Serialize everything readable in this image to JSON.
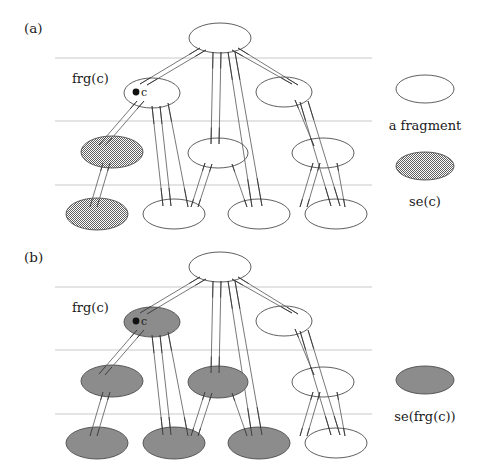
{
  "figure": {
    "background_color": "#ffffff",
    "outline_color": "#4d4d4d",
    "edge_color": "#555555",
    "guide_line_color": "#c9c9c9",
    "marker_color": "#111111",
    "text_color": "#1a1a1a",
    "shade_color_a": "#9a9a9a",
    "shade_color_b": "#8c8c8c"
  },
  "panels": [
    {
      "id": "a",
      "label": "(a)",
      "frg_label": "frg(c)",
      "c_label": "c",
      "legend": [
        {
          "id": "legend-fragment-a",
          "label": "a fragment",
          "style": "outline"
        },
        {
          "id": "legend-se-c",
          "label": "se(c)",
          "style": "shaded-halftone"
        }
      ],
      "guide_lines_y": [
        58,
        121,
        185
      ],
      "guide_line_x": [
        55,
        372
      ],
      "nodes": [
        {
          "id": "a-root",
          "cx": 220,
          "cy": 38,
          "rx": 31,
          "ry": 15,
          "shaded": false
        },
        {
          "id": "a-l2-1",
          "cx": 152,
          "cy": 93,
          "rx": 28,
          "ry": 15,
          "shaded": false,
          "marked": true
        },
        {
          "id": "a-l2-2",
          "cx": 284,
          "cy": 92,
          "rx": 28,
          "ry": 15,
          "shaded": false
        },
        {
          "id": "a-l3-1",
          "cx": 112,
          "cy": 152,
          "rx": 31,
          "ry": 16,
          "shaded": true
        },
        {
          "id": "a-l3-2",
          "cx": 218,
          "cy": 153,
          "rx": 30,
          "ry": 15,
          "shaded": false
        },
        {
          "id": "a-l3-3",
          "cx": 323,
          "cy": 153,
          "rx": 31,
          "ry": 15,
          "shaded": false
        },
        {
          "id": "a-l4-1",
          "cx": 97,
          "cy": 214,
          "rx": 31,
          "ry": 16,
          "shaded": true
        },
        {
          "id": "a-l4-2",
          "cx": 174,
          "cy": 214,
          "rx": 31,
          "ry": 15,
          "shaded": false
        },
        {
          "id": "a-l4-3",
          "cx": 259,
          "cy": 214,
          "rx": 31,
          "ry": 15,
          "shaded": false
        },
        {
          "id": "a-l4-4",
          "cx": 336,
          "cy": 214,
          "rx": 31,
          "ry": 15,
          "shaded": false
        }
      ],
      "edges": [
        [
          200,
          48,
          140,
          84
        ],
        [
          206,
          50,
          147,
          85
        ],
        [
          213,
          52,
          211,
          144
        ],
        [
          221,
          52,
          219,
          144
        ],
        [
          232,
          50,
          292,
          84
        ],
        [
          238,
          48,
          298,
          85
        ],
        [
          137,
          101,
          99,
          145
        ],
        [
          144,
          101,
          105,
          146
        ],
        [
          152,
          106,
          163,
          206
        ],
        [
          160,
          106,
          171,
          206
        ],
        [
          168,
          103,
          188,
          207
        ],
        [
          228,
          52,
          252,
          207
        ],
        [
          235,
          52,
          262,
          206
        ],
        [
          300,
          102,
          331,
          206
        ],
        [
          308,
          101,
          340,
          206
        ],
        [
          295,
          100,
          314,
          146
        ],
        [
          103,
          163,
          90,
          207
        ],
        [
          110,
          163,
          97,
          207
        ],
        [
          205,
          163,
          191,
          207
        ],
        [
          212,
          164,
          198,
          207
        ],
        [
          232,
          164,
          247,
          207
        ],
        [
          313,
          163,
          300,
          207
        ],
        [
          320,
          163,
          307,
          207
        ],
        [
          337,
          163,
          345,
          207
        ]
      ],
      "marker": {
        "cx": 136,
        "cy": 92,
        "r": 3.4
      },
      "frg_label_pos": {
        "x": 72,
        "y": 83
      },
      "c_label_pos": {
        "x": 141,
        "y": 96
      },
      "panel_label_pos": {
        "x": 24,
        "y": 33
      },
      "legend_pos": {
        "fragment_ellipse": {
          "cx": 425,
          "cy": 89,
          "rx": 29,
          "ry": 14
        },
        "fragment_text": {
          "x": 425,
          "y": 130
        },
        "se_ellipse": {
          "cx": 425,
          "cy": 166,
          "rx": 29,
          "ry": 14
        },
        "se_text": {
          "x": 425,
          "y": 206
        }
      }
    },
    {
      "id": "b",
      "label": "(b)",
      "frg_label": "frg(c)",
      "c_label": "c",
      "legend": [
        {
          "id": "legend-se-frg-c",
          "label": "se(frg(c))",
          "style": "shaded-solid"
        }
      ],
      "guide_lines_y": [
        287,
        350,
        414
      ],
      "guide_line_x": [
        55,
        372
      ],
      "nodes": [
        {
          "id": "b-root",
          "cx": 220,
          "cy": 267,
          "rx": 31,
          "ry": 15,
          "shaded": false
        },
        {
          "id": "b-l2-1",
          "cx": 152,
          "cy": 322,
          "rx": 28,
          "ry": 15,
          "shaded": true,
          "marked": true
        },
        {
          "id": "b-l2-2",
          "cx": 284,
          "cy": 321,
          "rx": 28,
          "ry": 15,
          "shaded": false
        },
        {
          "id": "b-l3-1",
          "cx": 112,
          "cy": 381,
          "rx": 31,
          "ry": 16,
          "shaded": true
        },
        {
          "id": "b-l3-2",
          "cx": 218,
          "cy": 382,
          "rx": 30,
          "ry": 16,
          "shaded": true
        },
        {
          "id": "b-l3-3",
          "cx": 323,
          "cy": 382,
          "rx": 31,
          "ry": 15,
          "shaded": false
        },
        {
          "id": "b-l4-1",
          "cx": 97,
          "cy": 443,
          "rx": 31,
          "ry": 16,
          "shaded": true
        },
        {
          "id": "b-l4-2",
          "cx": 174,
          "cy": 443,
          "rx": 31,
          "ry": 16,
          "shaded": true
        },
        {
          "id": "b-l4-3",
          "cx": 259,
          "cy": 443,
          "rx": 31,
          "ry": 16,
          "shaded": true
        },
        {
          "id": "b-l4-4",
          "cx": 336,
          "cy": 443,
          "rx": 31,
          "ry": 15,
          "shaded": false
        }
      ],
      "edges": [
        [
          200,
          277,
          140,
          313
        ],
        [
          206,
          279,
          147,
          314
        ],
        [
          213,
          281,
          211,
          373
        ],
        [
          221,
          281,
          219,
          373
        ],
        [
          232,
          279,
          292,
          313
        ],
        [
          238,
          277,
          298,
          314
        ],
        [
          137,
          330,
          99,
          374
        ],
        [
          144,
          330,
          105,
          375
        ],
        [
          152,
          335,
          163,
          435
        ],
        [
          160,
          335,
          171,
          435
        ],
        [
          168,
          332,
          188,
          436
        ],
        [
          228,
          281,
          252,
          436
        ],
        [
          235,
          281,
          262,
          435
        ],
        [
          300,
          331,
          331,
          435
        ],
        [
          308,
          330,
          340,
          435
        ],
        [
          295,
          329,
          314,
          375
        ],
        [
          103,
          392,
          90,
          436
        ],
        [
          110,
          392,
          97,
          436
        ],
        [
          205,
          392,
          191,
          436
        ],
        [
          212,
          393,
          198,
          436
        ],
        [
          232,
          393,
          247,
          436
        ],
        [
          313,
          392,
          300,
          436
        ],
        [
          320,
          392,
          307,
          436
        ],
        [
          337,
          392,
          345,
          436
        ]
      ],
      "marker": {
        "cx": 136,
        "cy": 321,
        "r": 3.4
      },
      "frg_label_pos": {
        "x": 72,
        "y": 312
      },
      "c_label_pos": {
        "x": 141,
        "y": 325
      },
      "panel_label_pos": {
        "x": 24,
        "y": 262
      },
      "legend_pos": {
        "se_ellipse": {
          "cx": 425,
          "cy": 380,
          "rx": 29,
          "ry": 14
        },
        "se_text": {
          "x": 425,
          "y": 421
        }
      }
    }
  ]
}
